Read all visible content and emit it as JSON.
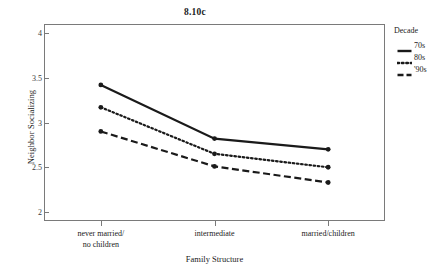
{
  "chart_data": {
    "type": "line",
    "title": "8.10c",
    "xlabel": "Family Structure",
    "ylabel": "Neighbor Socializing",
    "categories": [
      "never married/\nno children",
      "intermediate",
      "married/children"
    ],
    "category_labels": [
      [
        "never married/",
        "no children"
      ],
      [
        "intermediate"
      ],
      [
        "married/children"
      ]
    ],
    "ylim": [
      1.9,
      4.1
    ],
    "yticks": [
      4,
      3.5,
      3,
      2.5,
      2
    ],
    "ytick_labels": [
      "4",
      "3.5",
      "3",
      "2.5",
      "2"
    ],
    "grid": false,
    "legend_position": "right",
    "legend_title": "Decade",
    "series": [
      {
        "name": "70s",
        "style": "solid",
        "values": [
          3.42,
          2.82,
          2.7
        ]
      },
      {
        "name": "80s",
        "style": "dotted",
        "values": [
          3.17,
          2.65,
          2.5
        ]
      },
      {
        "name": "'90s",
        "style": "dashed",
        "values": [
          2.9,
          2.51,
          2.33
        ]
      }
    ]
  },
  "colors": {
    "line": "#1a1a1a",
    "axis": "#7a7a7a",
    "background": "#ffffff"
  }
}
